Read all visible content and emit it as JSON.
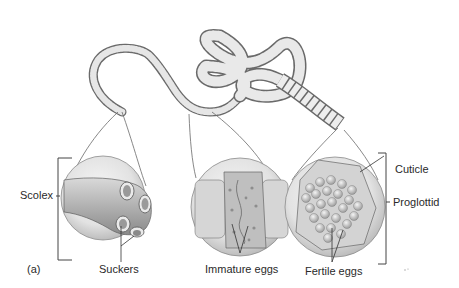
{
  "figure": {
    "panel_label": "(a)",
    "labels": {
      "scolex": "Scolex",
      "suckers": "Suckers",
      "immature_eggs": "Immature eggs",
      "fertile_eggs": "Fertile eggs",
      "cuticle": "Cuticle",
      "proglottid": "Proglottid"
    },
    "insets": [
      {
        "name": "scolex-detail",
        "callout_labels": [
          "Scolex",
          "Suckers"
        ]
      },
      {
        "name": "immature-proglottid-detail",
        "callout_labels": [
          "Immature eggs"
        ]
      },
      {
        "name": "mature-proglottid-detail",
        "callout_labels": [
          "Fertile eggs",
          "Cuticle",
          "Proglottid"
        ]
      }
    ],
    "colors": {
      "background": "#ffffff",
      "body_fill": "#e4e4e4",
      "body_shade": "#a8a8a8",
      "outline": "#5a5a5a",
      "text": "#2a2a2a"
    }
  }
}
